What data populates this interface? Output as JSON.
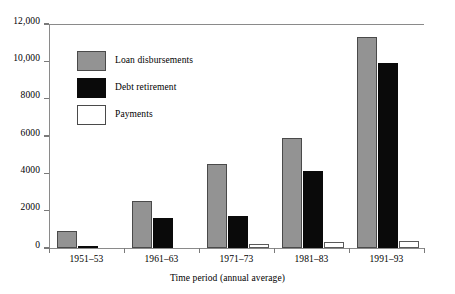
{
  "chart_data": {
    "type": "bar",
    "title": "",
    "subtitle": "",
    "xlabel": "Time period (annual average)",
    "ylabel": "",
    "categories": [
      "1951–53",
      "1961–63",
      "1971–73",
      "1981–83",
      "1991–93"
    ],
    "series": [
      {
        "name": "Loan disbursements",
        "color": "#939393",
        "values": [
          900,
          2500,
          4500,
          5900,
          11300
        ]
      },
      {
        "name": "Debt retirement",
        "color": "#0a0a0a",
        "values": [
          100,
          1600,
          1700,
          4150,
          9900
        ]
      },
      {
        "name": "Payments",
        "color": "#ffffff",
        "values": [
          0,
          0,
          200,
          300,
          375
        ]
      }
    ],
    "ylim": [
      0,
      12000
    ],
    "ytick_values": [
      0,
      2000,
      4000,
      6000,
      8000,
      10000,
      12000
    ],
    "ytick_labels": [
      "0",
      "2000",
      "4000",
      "6000",
      "8000",
      "10,000",
      "12,000"
    ],
    "grid": false,
    "legend_position": "inside-top-left",
    "legend": [
      {
        "label": "Loan disbursements",
        "swatch": "loan"
      },
      {
        "label": "Debt retirement",
        "swatch": "debt"
      },
      {
        "label": "Payments",
        "swatch": "pay"
      }
    ]
  }
}
